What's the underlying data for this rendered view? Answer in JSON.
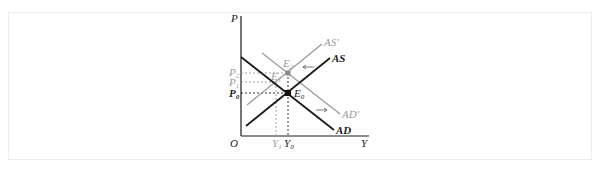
{
  "top_text": "",
  "diagram": {
    "axes": {
      "y_label": "P",
      "x_label": "Y",
      "origin_label": "O"
    },
    "price_labels": [
      {
        "text": "P",
        "sub": "2",
        "color": "#9a9a9a"
      },
      {
        "text": "P",
        "sub": "1",
        "color": "#9a9a9a"
      },
      {
        "text": "P",
        "sub": "0",
        "color": "#1a1a1a"
      }
    ],
    "output_labels": [
      {
        "text": "Y",
        "sub": "1",
        "color": "#9a9a9a"
      },
      {
        "text": "Y",
        "sub": "0",
        "color": "#1a1a1a"
      }
    ],
    "curves": [
      {
        "name": "AS'",
        "color": "#9a9a9a"
      },
      {
        "name": "AS",
        "color": "#1a1a1a"
      },
      {
        "name": "AD'",
        "color": "#9a9a9a"
      },
      {
        "name": "AD",
        "color": "#1a1a1a"
      }
    ],
    "points": [
      {
        "text": "E",
        "sub": "2",
        "color": "#9a9a9a"
      },
      {
        "text": "E",
        "sub": "1",
        "color": "#9a9a9a"
      },
      {
        "text": "E",
        "sub": "0",
        "color": "#1a1a1a"
      }
    ],
    "arrows": [
      {
        "direction": "left",
        "meaning": "AS shifts left to AS'"
      },
      {
        "direction": "right",
        "meaning": "AD shifts right to AD'"
      }
    ]
  }
}
